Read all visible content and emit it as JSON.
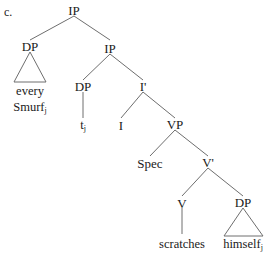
{
  "figure": {
    "example_label": "c.",
    "type": "syntax-tree"
  },
  "nodes": {
    "root_ip": "IP",
    "subject_dp": "DP",
    "lower_ip": "IP",
    "trace_dp": "DP",
    "i_bar": "I'",
    "i_head": "I",
    "vp": "VP",
    "spec": "Spec",
    "v_bar": "V'",
    "v_head": "V",
    "object_dp": "DP"
  },
  "leaves": {
    "every": "every",
    "smurf": "Smurf",
    "smurf_subscript": "j",
    "trace": "t",
    "trace_subscript": "j",
    "scratches": "scratches",
    "himself": "himself",
    "himself_subscript": "j"
  },
  "colors": {
    "line": "#6e6e6e",
    "text": "#1a1a1a",
    "background": "#ffffff"
  }
}
